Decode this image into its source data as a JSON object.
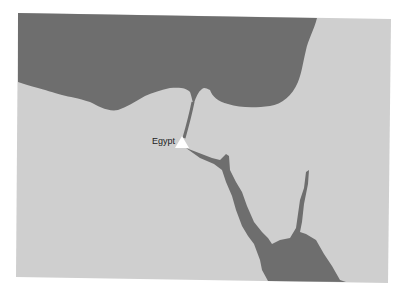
{
  "map": {
    "colors": {
      "land": "#cfcfcf",
      "water": "#6e6e6e",
      "marker": "#ffffff",
      "background": "#ffffff"
    },
    "markers": [
      {
        "label": "Egypt",
        "icon": "triangle-marker-icon"
      }
    ]
  }
}
